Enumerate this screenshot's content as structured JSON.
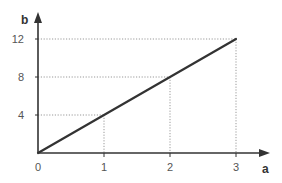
{
  "chart_data": {
    "type": "line",
    "title": "",
    "xlabel": "a",
    "ylabel": "b",
    "x": [
      0,
      1,
      2,
      3
    ],
    "series": [
      {
        "name": "b = 4a",
        "values": [
          0,
          4,
          8,
          12
        ]
      }
    ],
    "x_ticks": [
      "0",
      "1",
      "2",
      "3"
    ],
    "y_ticks": [
      "4",
      "8",
      "12"
    ],
    "xlim": [
      0,
      3.45
    ],
    "ylim": [
      0,
      14.2
    ],
    "grid": false,
    "guide_lines": "dotted drop lines from each data point (1,4), (2,8), (3,12) to both axes",
    "legend": "none",
    "colors": {
      "line": "#333333",
      "axis": "#333333",
      "guide": "#999999"
    }
  }
}
